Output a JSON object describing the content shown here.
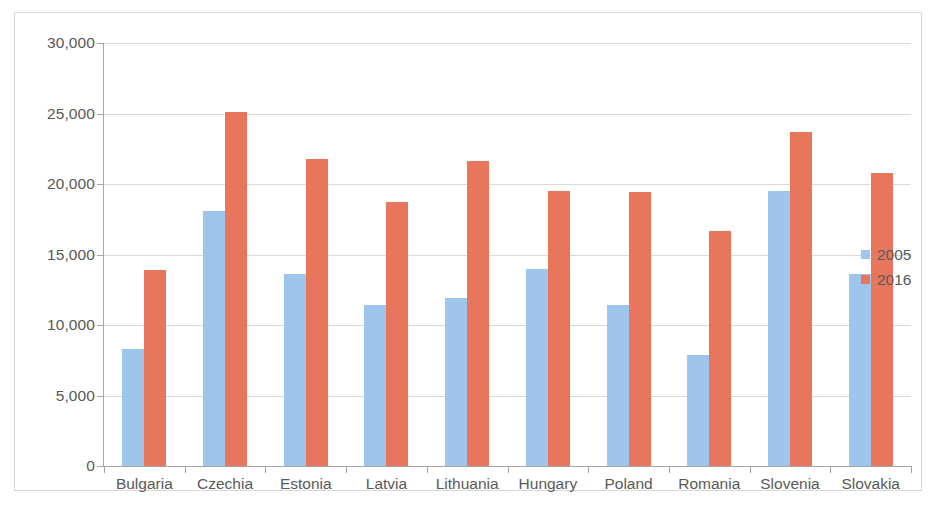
{
  "chart_data": {
    "type": "bar",
    "title": "",
    "subtitle": "",
    "xlabel": "",
    "ylabel": "",
    "categories": [
      "Bulgaria",
      "Czechia",
      "Estonia",
      "Latvia",
      "Lithuania",
      "Hungary",
      "Poland",
      "Romania",
      "Slovenia",
      "Slovakia"
    ],
    "series": [
      {
        "name": "2005",
        "color": "#9ec5ec",
        "values": [
          8300,
          18100,
          13600,
          11400,
          11900,
          14000,
          11400,
          7900,
          19500,
          13600
        ]
      },
      {
        "name": "2016",
        "color": "#e8765c",
        "values": [
          13900,
          25100,
          21800,
          18700,
          21600,
          19500,
          19400,
          16700,
          23700,
          20800
        ]
      }
    ],
    "ylim": [
      0,
      30000
    ],
    "ytick_values": [
      30000,
      25000,
      20000,
      15000,
      10000,
      5000,
      0
    ],
    "ytick_labels": [
      "30,000",
      "25,000",
      "20,000",
      "15,000",
      "10,000",
      "5,000",
      "0"
    ],
    "grid": true,
    "grid_axis": "y",
    "legend_position": "right",
    "legend_entries": [
      "2005",
      "2016"
    ],
    "annotations": []
  },
  "colors": {
    "series_2005": "#9ec5ec",
    "series_2016": "#e8765c",
    "gridline": "#d9d9d9",
    "axis": "#a6a6a6",
    "text": "#595959",
    "frame_border": "#d8d8d8",
    "background": "#ffffff"
  }
}
